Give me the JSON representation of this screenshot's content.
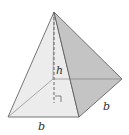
{
  "figure": {
    "type": "square pyramid",
    "labels": {
      "height": "h",
      "base_front": "b",
      "base_side": "b"
    },
    "right_angle_marker": true,
    "colors": {
      "front_face": "#e9e9e9",
      "side_face": "#bdbdbd",
      "edge": "#555555",
      "height_line": "#666666"
    }
  }
}
